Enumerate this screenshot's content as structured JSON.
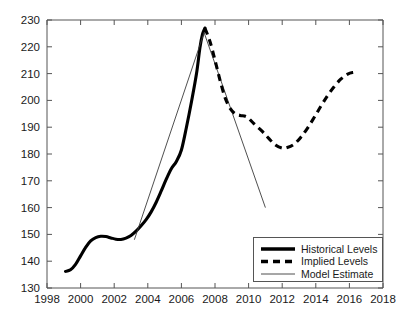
{
  "chart_data": {
    "type": "line",
    "title": "",
    "xlabel": "",
    "ylabel": "",
    "xlim": [
      1998,
      2018
    ],
    "ylim": [
      130,
      230
    ],
    "grid": false,
    "legend_position": "bottom-right",
    "xticks": [
      1998,
      2000,
      2002,
      2004,
      2006,
      2008,
      2010,
      2012,
      2014,
      2016,
      2018
    ],
    "xtick_labels": [
      "1998",
      "2000",
      "2002",
      "2004",
      "2006",
      "2008",
      "2010",
      "2012",
      "2014",
      "2016",
      "2018"
    ],
    "yticks": [
      130,
      140,
      150,
      160,
      170,
      180,
      190,
      200,
      210,
      220,
      230
    ],
    "ytick_labels": [
      "130",
      "140",
      "150",
      "160",
      "170",
      "180",
      "190",
      "200",
      "210",
      "220",
      "230"
    ],
    "series": [
      {
        "name": "Historical Levels",
        "style": "thick-solid",
        "color": "#000000",
        "x": [
          1999.1,
          1999.4,
          1999.7,
          2000.0,
          2000.3,
          2000.6,
          2000.9,
          2001.2,
          2001.5,
          2001.8,
          2002.1,
          2002.4,
          2002.7,
          2003.0,
          2003.3,
          2003.6,
          2003.9,
          2004.2,
          2004.5,
          2004.8,
          2005.1,
          2005.4,
          2005.7,
          2006.0,
          2006.3,
          2006.6,
          2006.9,
          2007.1,
          2007.25,
          2007.4
        ],
        "y": [
          136.2,
          136.8,
          138.8,
          142.0,
          145.2,
          147.6,
          148.8,
          149.3,
          149.2,
          148.7,
          148.2,
          148.1,
          148.6,
          149.6,
          151.2,
          153.2,
          155.5,
          158.4,
          162.0,
          166.2,
          170.6,
          174.5,
          177.2,
          181.5,
          190.0,
          199.5,
          210.0,
          219.5,
          224.5,
          227.0
        ]
      },
      {
        "name": "Implied Levels",
        "style": "thick-dashed",
        "color": "#000000",
        "x": [
          2007.4,
          2007.7,
          2008.0,
          2008.3,
          2008.6,
          2008.9,
          2009.2,
          2009.5,
          2009.9,
          2010.3,
          2010.8,
          2011.2,
          2011.6,
          2012.0,
          2012.3,
          2012.7,
          2013.1,
          2013.5,
          2013.9,
          2014.3,
          2014.7,
          2015.1,
          2015.5,
          2015.9,
          2016.2,
          2016.5
        ],
        "y": [
          227.0,
          222.0,
          215.0,
          207.5,
          201.0,
          197.0,
          195.0,
          194.4,
          193.8,
          191.4,
          188.5,
          185.8,
          183.4,
          182.2,
          182.4,
          183.6,
          186.2,
          189.6,
          193.6,
          197.8,
          201.8,
          205.2,
          208.0,
          209.8,
          210.4,
          210.5
        ]
      },
      {
        "name": "Model Estimate",
        "style": "thin-solid",
        "color": "#3b3b3b",
        "x": [
          2003.2,
          2007.35,
          2011.0
        ],
        "y": [
          148.0,
          225.3,
          160.0
        ]
      }
    ]
  },
  "legend": {
    "entries": [
      {
        "label": "Historical Levels",
        "style": "thick-solid"
      },
      {
        "label": "Implied Levels",
        "style": "thick-dashed"
      },
      {
        "label": "Model Estimate",
        "style": "thin-solid"
      }
    ]
  }
}
